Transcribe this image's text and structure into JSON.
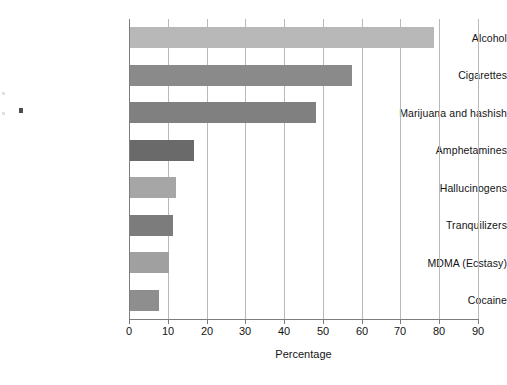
{
  "chart_data": {
    "type": "bar",
    "orientation": "horizontal",
    "title": "",
    "xlabel": "Percentage",
    "ylabel": "",
    "xlim": [
      0,
      90
    ],
    "xticks": [
      0,
      10,
      20,
      30,
      40,
      50,
      60,
      70,
      80,
      90
    ],
    "xtick_labels": [
      "0",
      "10",
      "20",
      "30",
      "40",
      "50",
      "60",
      "70",
      "80",
      "90"
    ],
    "grid": "vertical",
    "legend": "none",
    "categories": [
      "Alcohol",
      "Cigarettes",
      "Marijuana and hashish",
      "Amphetamines",
      "Hallucinogens",
      "Tranquilizers",
      "MDMA (Ecstasy)",
      "Cocaine"
    ],
    "values": [
      78.4,
      57.2,
      48.0,
      16.5,
      11.9,
      11.0,
      10.0,
      7.5
    ],
    "bar_colors": [
      "#b8b8b8",
      "#8a8a8a",
      "#808080",
      "#6a6a6a",
      "#a6a6a6",
      "#7c7c7c",
      "#a0a0a0",
      "#8e8e8e"
    ],
    "points": [
      {
        "label": "Alcohol",
        "value": 78.4,
        "color": "#b8b8b8"
      },
      {
        "label": "Cigarettes",
        "value": 57.2,
        "color": "#8a8a8a"
      },
      {
        "label": "Marijuana and hashish",
        "value": 48.0,
        "color": "#808080"
      },
      {
        "label": "Amphetamines",
        "value": 16.5,
        "color": "#6a6a6a"
      },
      {
        "label": "Hallucinogens",
        "value": 11.9,
        "color": "#a6a6a6"
      },
      {
        "label": "Tranquilizers",
        "value": 11.0,
        "color": "#7c7c7c"
      },
      {
        "label": "MDMA (Ecstasy)",
        "value": 10.0,
        "color": "#a0a0a0"
      },
      {
        "label": "Cocaine",
        "value": 7.5,
        "color": "#8e8e8e"
      }
    ]
  },
  "axes": {
    "grid_color": "#b9b9b9",
    "axis_color": "#7d7d7d"
  }
}
